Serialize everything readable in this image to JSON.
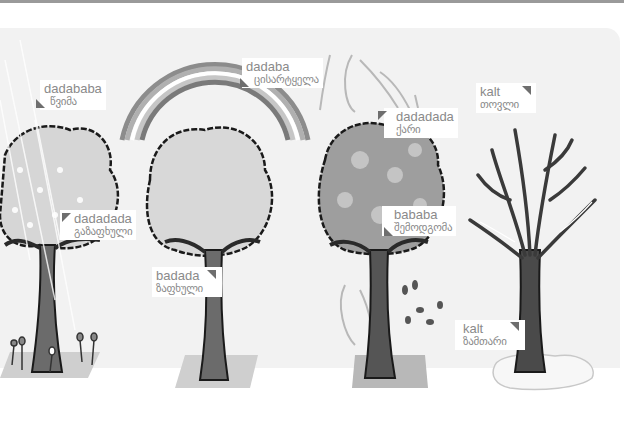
{
  "illustration": {
    "title": "",
    "trees": [
      {
        "name": "spring-rain-tree",
        "season": "spring"
      },
      {
        "name": "summer-rainbow-tree",
        "season": "summer"
      },
      {
        "name": "autumn-wind-tree",
        "season": "autumn"
      },
      {
        "name": "winter-bare-tree",
        "season": "winter"
      }
    ],
    "labels": {
      "rain": {
        "en": "dadababa",
        "ka": "წვიმა"
      },
      "rainbow": {
        "en": "dadaba",
        "ka": "ცისარტყელა"
      },
      "wind": {
        "en": "dadadada",
        "ka": "ქარი"
      },
      "snow": {
        "en": "kalt",
        "ka": "თოვლი"
      },
      "spring": {
        "en": "dadadada",
        "ka": "გაზაფხული"
      },
      "summer": {
        "en": "badada",
        "ka": "ზაფხული"
      },
      "autumn": {
        "en": "bababa",
        "ka": "შემოდგომა"
      },
      "winter": {
        "en": "kalt",
        "ka": "ზამთარი"
      }
    },
    "colors": {
      "background": "#ffffff",
      "panel": "#f2f2f2",
      "label_text": "#8a8a8a",
      "marker": "#6e6e6e",
      "foliage_light": "#d4d4d4",
      "foliage_dark": "#9c9c9c",
      "trunk": "#5a5a5a",
      "ground": "#c8c8c8"
    }
  }
}
